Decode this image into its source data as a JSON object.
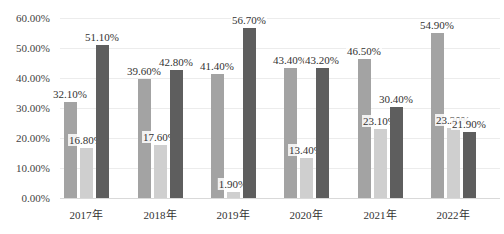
{
  "chart_data": {
    "type": "bar",
    "title": "",
    "xlabel": "",
    "ylabel": "",
    "ylim": [
      0,
      60
    ],
    "y_ticks": [
      "0.00%",
      "10.00%",
      "20.00%",
      "30.00%",
      "40.00%",
      "50.00%",
      "60.00%"
    ],
    "grid": true,
    "legend_position": "bottom",
    "categories": [
      "2017年",
      "2018年",
      "2019年",
      "2020年",
      "2021年",
      "2022年"
    ],
    "series": [
      {
        "name": "",
        "color": "#a3a3a3",
        "values": [
          32.1,
          39.6,
          41.4,
          43.4,
          46.5,
          54.9
        ],
        "labels": [
          "32.10%",
          "39.60%",
          "41.40%",
          "43.40%",
          "46.50%",
          "54.90%"
        ]
      },
      {
        "name": "",
        "color": "#cfcfcf",
        "values": [
          16.8,
          17.6,
          1.9,
          13.4,
          23.1,
          23.2
        ],
        "labels": [
          "16.80%",
          "17.60%",
          "1.90%",
          "13.40%",
          "23.10%",
          "23.20%"
        ]
      },
      {
        "name": "",
        "color": "#5e5e5e",
        "values": [
          51.1,
          42.8,
          56.7,
          43.2,
          30.4,
          21.9
        ],
        "labels": [
          "51.10%",
          "42.80%",
          "56.70%",
          "43.20%",
          "30.40%",
          "21.90%"
        ]
      }
    ]
  }
}
